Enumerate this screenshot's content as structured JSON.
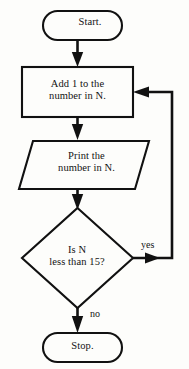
{
  "diagram": {
    "colors": {
      "stroke": "#111111",
      "fill": "#fdfdfb",
      "text": "#131313",
      "background": "#ffffff"
    },
    "nodes": [
      {
        "id": "start",
        "shape": "terminator",
        "text": "Start."
      },
      {
        "id": "process-add",
        "shape": "process",
        "text": "Add 1 to the\nnumber in N."
      },
      {
        "id": "output-print",
        "shape": "input-output",
        "text": "Print the\nnumber in N."
      },
      {
        "id": "decision-test",
        "shape": "decision",
        "text": "Is N\nless than 15?"
      },
      {
        "id": "stop",
        "shape": "terminator",
        "text": "Stop."
      }
    ],
    "edges": [
      {
        "id": "start-to-process",
        "from": "start",
        "to": "process-add",
        "label": ""
      },
      {
        "id": "process-to-output",
        "from": "process-add",
        "to": "output-print",
        "label": ""
      },
      {
        "id": "output-to-decision",
        "from": "output-print",
        "to": "decision-test",
        "label": ""
      },
      {
        "id": "decision-yes-loop",
        "from": "decision-test",
        "to": "process-add",
        "label": "yes"
      },
      {
        "id": "decision-no-stop",
        "from": "decision-test",
        "to": "stop",
        "label": "no"
      }
    ]
  }
}
